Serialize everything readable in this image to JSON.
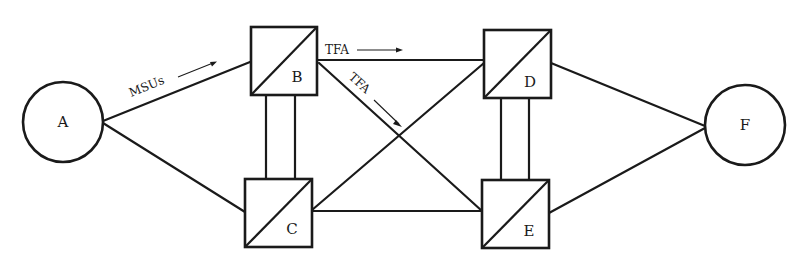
{
  "diagram": {
    "type": "network-topology",
    "nodes": [
      {
        "id": "A",
        "label": "A",
        "kind": "endpoint-circle"
      },
      {
        "id": "B",
        "label": "B",
        "kind": "transfer-point-box"
      },
      {
        "id": "C",
        "label": "C",
        "kind": "transfer-point-box"
      },
      {
        "id": "D",
        "label": "D",
        "kind": "transfer-point-box"
      },
      {
        "id": "E",
        "label": "E",
        "kind": "transfer-point-box"
      },
      {
        "id": "F",
        "label": "F",
        "kind": "endpoint-circle"
      }
    ],
    "edges": [
      {
        "from": "A",
        "to": "B",
        "label": "MSUs",
        "arrow": "A-to-B"
      },
      {
        "from": "A",
        "to": "C"
      },
      {
        "from": "B",
        "to": "C",
        "kind": "double-link"
      },
      {
        "from": "B",
        "to": "D",
        "label": "TFA",
        "arrow": "B-to-D"
      },
      {
        "from": "B",
        "to": "E",
        "label": "TFA",
        "arrow": "B-to-E"
      },
      {
        "from": "C",
        "to": "D"
      },
      {
        "from": "C",
        "to": "E"
      },
      {
        "from": "D",
        "to": "E",
        "kind": "double-link"
      },
      {
        "from": "D",
        "to": "F"
      },
      {
        "from": "E",
        "to": "F"
      }
    ],
    "labels": {
      "msus": "MSUs",
      "tfa_top": "TFA",
      "tfa_diag": "TFA"
    },
    "colors": {
      "line": "#1a1a1a",
      "background": "#ffffff"
    }
  }
}
